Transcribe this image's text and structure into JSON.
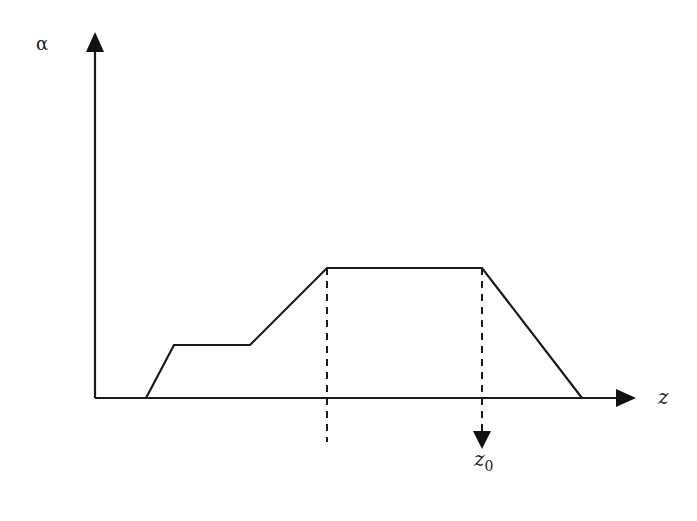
{
  "diagram": {
    "type": "piecewise-linear profile",
    "axes": {
      "y_label": "α",
      "x_label": "z"
    },
    "marker": {
      "label_base": "z",
      "label_sub": "0"
    },
    "profile_points": [
      [
        146,
        398
      ],
      [
        174,
        345
      ],
      [
        250,
        345
      ],
      [
        327,
        268
      ],
      [
        482,
        268
      ],
      [
        582,
        398
      ]
    ],
    "colors": {
      "line": "#1a1a1a",
      "background": "#ffffff"
    }
  }
}
